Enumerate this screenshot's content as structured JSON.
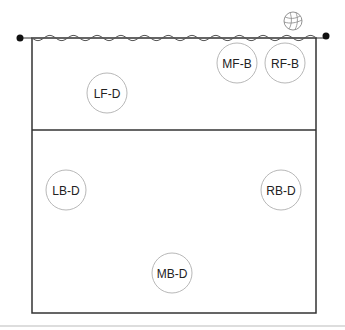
{
  "diagram": {
    "type": "volleyball-court-rotation",
    "colors": {
      "court_line": "#333333",
      "net": "#555555",
      "post": "#111111",
      "player_circle": "#b8b8b8",
      "player_text": "#222222",
      "footer_line": "#bbbbbb"
    },
    "players": [
      {
        "id": "mf-b",
        "label": "MF-B",
        "cx": 237,
        "cy": 63
      },
      {
        "id": "rf-b",
        "label": "RF-B",
        "cx": 285,
        "cy": 63
      },
      {
        "id": "lf-d",
        "label": "LF-D",
        "cx": 107,
        "cy": 93
      },
      {
        "id": "lb-d",
        "label": "LB-D",
        "cx": 66,
        "cy": 190
      },
      {
        "id": "rb-d",
        "label": "RB-D",
        "cx": 281,
        "cy": 190
      },
      {
        "id": "mb-d",
        "label": "MB-D",
        "cx": 172,
        "cy": 273
      }
    ],
    "ball_icon": "volleyball-icon"
  }
}
